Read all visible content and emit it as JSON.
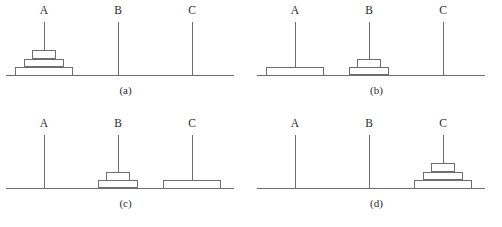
{
  "figure": {
    "peg_names": [
      "A",
      "B",
      "C"
    ],
    "disk_sizes": [
      "large",
      "medium",
      "small"
    ],
    "colors": {
      "line": "#6e6e6e",
      "text": "#2b2b2b",
      "background": "#ffffff",
      "disk_fill": "#ffffff"
    },
    "panels": [
      {
        "caption": "(a)",
        "pegs": [
          {
            "label": "A",
            "disks": [
              "large",
              "medium",
              "small"
            ]
          },
          {
            "label": "B",
            "disks": []
          },
          {
            "label": "C",
            "disks": []
          }
        ]
      },
      {
        "caption": "(b)",
        "pegs": [
          {
            "label": "A",
            "disks": [
              "large"
            ]
          },
          {
            "label": "B",
            "disks": [
              "medium",
              "small"
            ]
          },
          {
            "label": "C",
            "disks": []
          }
        ]
      },
      {
        "caption": "(c)",
        "pegs": [
          {
            "label": "A",
            "disks": []
          },
          {
            "label": "B",
            "disks": [
              "medium",
              "small"
            ]
          },
          {
            "label": "C",
            "disks": [
              "large"
            ]
          }
        ]
      },
      {
        "caption": "(d)",
        "pegs": [
          {
            "label": "A",
            "disks": []
          },
          {
            "label": "B",
            "disks": []
          },
          {
            "label": "C",
            "disks": [
              "large",
              "medium",
              "small"
            ]
          }
        ]
      }
    ]
  }
}
